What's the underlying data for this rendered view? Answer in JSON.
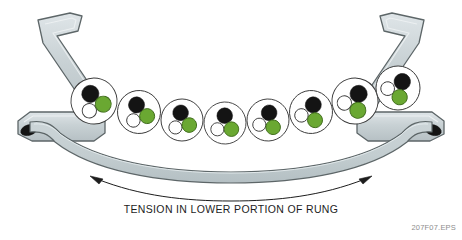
{
  "figure": {
    "caption": "TENSION IN LOWER PORTION OF RUNG",
    "figure_id": "207F07.EPS",
    "title": "Tension in lower portion of rung"
  },
  "colors": {
    "metal_fill": "#c3ccd0",
    "metal_fill_light": "#d6dee1",
    "metal_stroke": "#5d6668",
    "rung_fill": "#c3cdd0",
    "rung_stroke": "#5d6668",
    "circle_fill": "#ffffff",
    "circle_stroke": "#3a3a3a",
    "black_dot": "#141414",
    "white_dot": "#ffffff",
    "green_dot": "#6aa832",
    "green_dot_stroke": "#3f6b1c",
    "arrow": "#1d1d1d",
    "caption_text": "#1d1d1d",
    "figure_id_text": "#8d8d8d",
    "background": "#ffffff",
    "rivet": "#141414"
  },
  "parts": {
    "left_rail": "left side rail bracket",
    "right_rail": "right side rail bracket",
    "rung_beam": "sagging rung beam",
    "left_rivet": "left rivet hole",
    "right_rivet": "right rivet hole",
    "tension_arrow": "double headed tension arrow"
  },
  "molecule_circles": {
    "count": 8,
    "description": "grain structure circles along upper rung surface",
    "items": [
      {
        "index": 1,
        "cx": 94,
        "cy": 101,
        "r": 23.0,
        "rot": -27,
        "label": "grain-cell-1"
      },
      {
        "index": 2,
        "cx": 139,
        "cy": 112,
        "r": 21.5,
        "rot": -19,
        "label": "grain-cell-2"
      },
      {
        "index": 3,
        "cx": 182,
        "cy": 120,
        "r": 21.0,
        "rot": -11,
        "label": "grain-cell-3"
      },
      {
        "index": 4,
        "cx": 225,
        "cy": 123,
        "r": 21.0,
        "rot": -2,
        "label": "grain-cell-4"
      },
      {
        "index": 5,
        "cx": 268,
        "cy": 120,
        "r": 21.0,
        "rot": 9,
        "label": "grain-cell-5"
      },
      {
        "index": 6,
        "cx": 311,
        "cy": 112,
        "r": 21.5,
        "rot": 18,
        "label": "grain-cell-6"
      },
      {
        "index": 7,
        "cx": 355,
        "cy": 101,
        "r": 23.0,
        "rot": 27,
        "label": "grain-cell-7"
      },
      {
        "index": 8,
        "cx": 398,
        "cy": 88,
        "r": 22.0,
        "rot": 34,
        "label": "grain-cell-8"
      }
    ],
    "inner": {
      "black": {
        "dx": 0.0,
        "dy": -8.0,
        "r": 8.6,
        "name": "black-inner-dot"
      },
      "white": {
        "dx": -8.6,
        "dy": 6.6,
        "r": 7.2,
        "name": "white-inner-dot"
      },
      "green": {
        "dx": 6.8,
        "dy": 7.0,
        "r": 8.0,
        "name": "green-inner-dot"
      }
    }
  }
}
